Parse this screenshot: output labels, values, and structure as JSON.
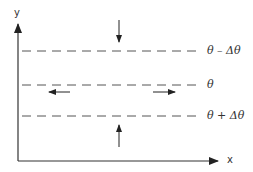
{
  "diagram": {
    "axes": {
      "x_label": "x",
      "y_label": "y",
      "color": "#333333"
    },
    "levels": [
      {
        "id": "upper",
        "label": "θ – Δθ",
        "y": 51
      },
      {
        "id": "middle",
        "label": "θ",
        "y": 85
      },
      {
        "id": "lower",
        "label": "θ + Δθ",
        "y": 116
      }
    ],
    "arrows": [
      {
        "id": "down-onto-upper",
        "direction": "down"
      },
      {
        "id": "left-on-middle",
        "direction": "left"
      },
      {
        "id": "right-on-middle",
        "direction": "right"
      },
      {
        "id": "up-onto-lower",
        "direction": "up"
      }
    ],
    "line_style": "dashed",
    "line_color": "#555555"
  }
}
